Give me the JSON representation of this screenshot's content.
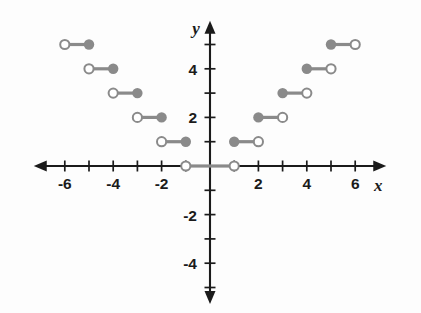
{
  "figure": {
    "title": "",
    "background_color": "#fdfdfd",
    "axis_color": "#1b1b1b",
    "segment_color": "#8a8a8a"
  },
  "axes": {
    "x_name": "x",
    "y_name": "y",
    "x_tick_labels": [
      "-6",
      "-4",
      "-2",
      "2",
      "4",
      "6"
    ],
    "y_tick_labels": [
      "4",
      "2",
      "-2",
      "-4"
    ]
  },
  "chart_data": {
    "type": "line",
    "title": "",
    "xlabel": "x",
    "ylabel": "y",
    "xlim": [
      -7.2,
      7.2
    ],
    "ylim": [
      -5.6,
      5.9
    ],
    "grid": false,
    "legend": "none",
    "x_ticks": [
      -6,
      -5,
      -4,
      -3,
      -2,
      -1,
      1,
      2,
      3,
      4,
      5,
      6
    ],
    "x_tick_labels_shown": [
      {
        "value": -6,
        "label": "-6"
      },
      {
        "value": -4,
        "label": "-4"
      },
      {
        "value": -2,
        "label": "-2"
      },
      {
        "value": 2,
        "label": "2"
      },
      {
        "value": 4,
        "label": "4"
      },
      {
        "value": 6,
        "label": "6"
      }
    ],
    "y_ticks": [
      -5,
      -4,
      -3,
      -2,
      -1,
      1,
      2,
      3,
      4,
      5
    ],
    "y_tick_labels_shown": [
      {
        "value": 4,
        "label": "4"
      },
      {
        "value": 2,
        "label": "2"
      },
      {
        "value": -2,
        "label": "-2"
      },
      {
        "value": -4,
        "label": "-4"
      }
    ],
    "segments": [
      {
        "x_start": -6,
        "x_end": -5,
        "y": 5,
        "left_endpoint": "open",
        "right_endpoint": "closed"
      },
      {
        "x_start": -5,
        "x_end": -4,
        "y": 4,
        "left_endpoint": "open",
        "right_endpoint": "closed"
      },
      {
        "x_start": -4,
        "x_end": -3,
        "y": 3,
        "left_endpoint": "open",
        "right_endpoint": "closed"
      },
      {
        "x_start": -3,
        "x_end": -2,
        "y": 2,
        "left_endpoint": "open",
        "right_endpoint": "closed"
      },
      {
        "x_start": -2,
        "x_end": -1,
        "y": 1,
        "left_endpoint": "open",
        "right_endpoint": "closed"
      },
      {
        "x_start": -1,
        "x_end": 0,
        "y": 0,
        "left_endpoint": "open",
        "right_endpoint": "none"
      },
      {
        "x_start": 0,
        "x_end": 1,
        "y": 0,
        "left_endpoint": "none",
        "right_endpoint": "open"
      },
      {
        "x_start": 1,
        "x_end": 2,
        "y": 1,
        "left_endpoint": "closed",
        "right_endpoint": "open"
      },
      {
        "x_start": 2,
        "x_end": 3,
        "y": 2,
        "left_endpoint": "closed",
        "right_endpoint": "open"
      },
      {
        "x_start": 3,
        "x_end": 4,
        "y": 3,
        "left_endpoint": "closed",
        "right_endpoint": "open"
      },
      {
        "x_start": 4,
        "x_end": 5,
        "y": 4,
        "left_endpoint": "closed",
        "right_endpoint": "open"
      },
      {
        "x_start": 5,
        "x_end": 6,
        "y": 5,
        "left_endpoint": "closed",
        "right_endpoint": "open"
      }
    ]
  }
}
